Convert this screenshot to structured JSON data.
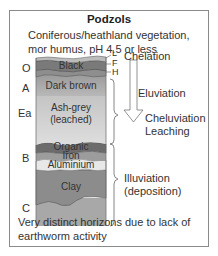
{
  "title": "Podzols",
  "subtitle_line1": "Coniferous/heathland vegetation,",
  "subtitle_line2": "mor humus, pH 4.5 or less",
  "horizons": {
    "O": "O",
    "A": "A",
    "Ea": "Ea",
    "B": "B",
    "C": "C"
  },
  "sub_horizons": {
    "L": "L",
    "F": "F",
    "H": "H"
  },
  "layers": {
    "black": "Black",
    "dark_brown": "Dark brown",
    "ash_grey_1": "Ash-grey",
    "ash_grey_2": "(leached)",
    "organic": "Organic",
    "iron": "Iron",
    "aluminium": "Aluminium",
    "clay": "Clay"
  },
  "processes": {
    "chelation": "Chelation",
    "eluviation": "Eluviation",
    "cheluviation": "Cheluviation",
    "leaching": "Leaching",
    "illuviation": "Illuviation",
    "deposition": "(deposition)"
  },
  "footer_line1": "Very distinct horizons due to lack of",
  "footer_line2": "earthworm activity",
  "colors": {
    "litter": "#c8c8c8",
    "black": "#7a7a7a",
    "dark_brown": "#a8a8a8",
    "ash_grey": "#d6d6d6",
    "organic": "#6e6e6e",
    "iron": "#9a9a9a",
    "aluminium": "#e6e6e6",
    "clay": "#8c8c8c",
    "c_horizon": "#a6a6a6"
  }
}
